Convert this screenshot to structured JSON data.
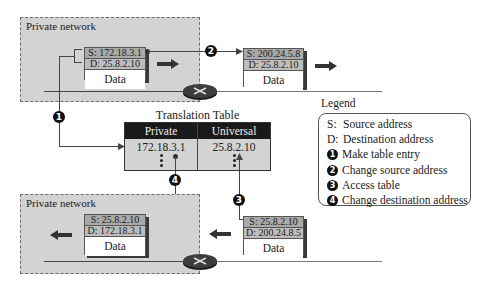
{
  "networks": {
    "top": {
      "label": "Private network"
    },
    "bottom": {
      "label": "Private network"
    }
  },
  "packets": {
    "outgoing_private": {
      "source": "S: 172.18.3.1",
      "destination": "D: 25.8.2.10",
      "data": "Data"
    },
    "outgoing_universal": {
      "source": "S: 200.24.5.8",
      "destination": "D: 25.8.2.10",
      "data": "Data"
    },
    "incoming_universal": {
      "source": "S: 25.8.2.10",
      "destination": "D: 200.24.8.5",
      "data": "Data"
    },
    "incoming_private": {
      "source": "S: 25.8.2.10",
      "destination": "D: 172.18.3.1",
      "data": "Data"
    }
  },
  "translation_table": {
    "title": "Translation Table",
    "columns": [
      "Private",
      "Universal"
    ],
    "rows": [
      [
        "172.18.3.1",
        "25.8.2.10"
      ]
    ]
  },
  "steps": {
    "s1": "1",
    "s2": "2",
    "s3": "3",
    "s4": "4"
  },
  "legend": {
    "title": "Legend",
    "items": [
      {
        "key": "S:",
        "text": "Source address"
      },
      {
        "key": "D:",
        "text": "Destination address"
      },
      {
        "key": "1",
        "text": "Make table entry"
      },
      {
        "key": "2",
        "text": "Change source address"
      },
      {
        "key": "3",
        "text": "Access table"
      },
      {
        "key": "4",
        "text": "Change destination address"
      }
    ]
  },
  "colors": {
    "network_fill": "#d3d3d3",
    "header_fill": "#1a1a1a",
    "source_row": "#a9a9a9",
    "dest_row": "#bdbdbd"
  }
}
